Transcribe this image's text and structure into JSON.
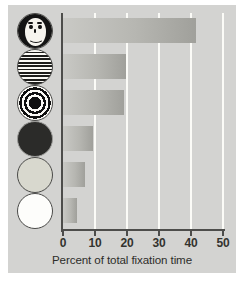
{
  "chart_data": {
    "type": "bar",
    "orientation": "horizontal",
    "title": "",
    "subtitle": "",
    "xlabel": "Percent of total fixation time",
    "ylabel": "",
    "xlim": [
      0,
      50
    ],
    "xticks": [
      0,
      10,
      20,
      30,
      40,
      50
    ],
    "xtick_labels": [
      "0",
      "10",
      "20",
      "30",
      "40",
      "50"
    ],
    "grid": "vertical gridlines at each x tick, white",
    "legend": "none",
    "categories": [
      "face-pattern-disc",
      "newsprint-stripes-disc",
      "bullseye-concentric-disc",
      "solid-dark-disc",
      "plain-light-yellow-disc",
      "plain-white-disc"
    ],
    "values": [
      41.5,
      19.7,
      19.0,
      9.4,
      6.9,
      4.4
    ],
    "series": [
      {
        "name": "Percent of total fixation time",
        "values": [
          41.5,
          19.7,
          19.0,
          9.4,
          6.9,
          4.4
        ]
      }
    ]
  },
  "axis": {
    "x_title": "Percent of total fixation time",
    "ticks": [
      {
        "label": "0",
        "value": 0
      },
      {
        "label": "10",
        "value": 10
      },
      {
        "label": "20",
        "value": 20
      },
      {
        "label": "30",
        "value": 30
      },
      {
        "label": "40",
        "value": 40
      },
      {
        "label": "50",
        "value": 50
      }
    ]
  },
  "stimuli": [
    {
      "name": "face-pattern-disc",
      "description": "schematic face",
      "value": 41.5
    },
    {
      "name": "newsprint-stripes-disc",
      "description": "newsprint",
      "value": 19.7
    },
    {
      "name": "bullseye-concentric-disc",
      "description": "bull's-eye",
      "value": 19.0
    },
    {
      "name": "solid-dark-disc",
      "description": "plain red",
      "value": 9.4
    },
    {
      "name": "plain-light-yellow-disc",
      "description": "plain yellow",
      "value": 6.9
    },
    {
      "name": "plain-white-disc",
      "description": "plain white",
      "value": 4.4
    }
  ],
  "colors": {
    "plate_background": "#d3d3d1",
    "bar_light": "#c9c9c5",
    "bar_dark": "#a0a09b",
    "gridline": "#fbfbf7",
    "axis": "#4d4d4b",
    "text": "#2d2d2a"
  },
  "caption": ""
}
